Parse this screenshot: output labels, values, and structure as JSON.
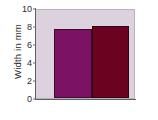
{
  "chart_data": {
    "type": "bar",
    "title": "",
    "xlabel": "",
    "ylabel": "Width in mm",
    "categories": [
      "",
      ""
    ],
    "values": [
      7.7,
      8.0
    ],
    "ylim": [
      0,
      10
    ],
    "yticks": [
      0,
      2,
      4,
      6,
      8,
      10
    ],
    "ytick_labels": [
      "0",
      "2",
      "4",
      "6",
      "8",
      "10"
    ],
    "xticks": [],
    "xtick_labels": [],
    "grid": false,
    "legend": false,
    "bar_colors": [
      "#7b1264",
      "#6b0220"
    ],
    "plot_background": "#dcd2de",
    "figure_background": "#ffffff",
    "axis_color": "#5e5e62",
    "text_color": "#2b2b2b"
  }
}
